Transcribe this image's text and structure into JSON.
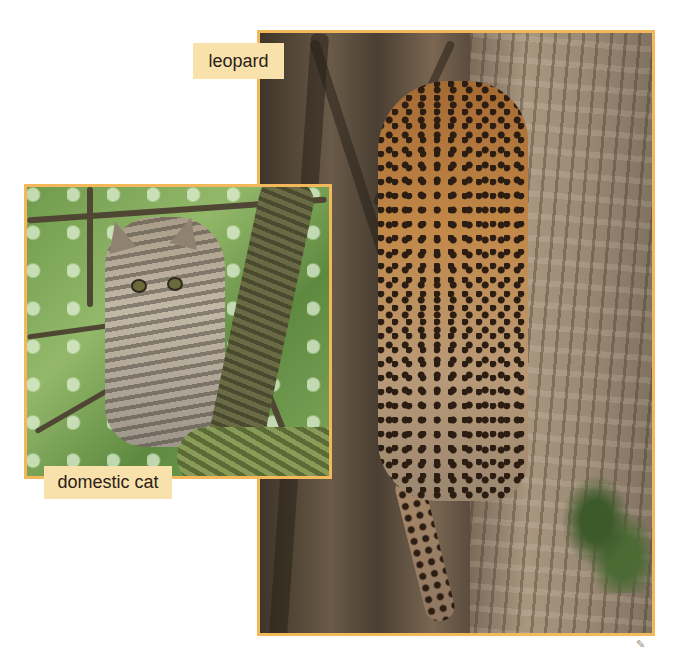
{
  "page": {
    "background": "#ffffff",
    "frame_color": "#f2b85a",
    "label_color": "#f9e1ac"
  },
  "photos": [
    {
      "id": "leopard",
      "caption": "leopard",
      "description": "young leopard climbing a tree trunk"
    },
    {
      "id": "domestic-cat",
      "caption": "domestic cat",
      "description": "tabby kitten sitting in a tree among green leaves"
    }
  ],
  "decor": {
    "page_mark_glyph": "✎"
  }
}
